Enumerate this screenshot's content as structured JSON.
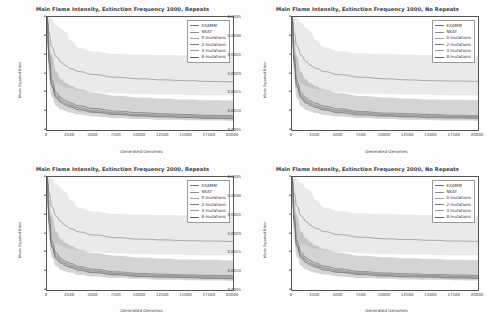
{
  "figure": {
    "background": "#fdfdfd",
    "axis_color": "#555555",
    "text_color": "#3c3c3c"
  },
  "common": {
    "xlabel": "Generated Genomes",
    "ylabel": "Mean Squared Error",
    "xticks": [
      "0",
      "2500",
      "5000",
      "7500",
      "10000",
      "12500",
      "15000",
      "17500",
      "20000"
    ],
    "xtick_values": [
      0,
      2500,
      5000,
      7500,
      10000,
      12500,
      15000,
      17500,
      20000
    ],
    "yticks": [
      "0.0035",
      "0.0030",
      "0.0025",
      "0.0020",
      "0.0015",
      "0.0010",
      "0.0005"
    ],
    "ytick_values": [
      0.0035,
      0.003,
      0.0025,
      0.002,
      0.0015,
      0.001,
      0.0005
    ],
    "xlim": [
      0,
      20000
    ],
    "ylim": [
      0.0005,
      0.0035
    ],
    "grid": false,
    "legend_position": "upper right"
  },
  "series_meta": [
    {
      "name": "EXAMM",
      "color": "#6e6e6e"
    },
    {
      "name": "NEAT",
      "color": "#8a8a8a"
    },
    {
      "name": "0 mutations",
      "color": "#a6a6a6"
    },
    {
      "name": "2 mutations",
      "color": "#7b7b7b"
    },
    {
      "name": "4 mutations",
      "color": "#9c9c9c"
    },
    {
      "name": "8 mutations",
      "color": "#5f5f5f"
    }
  ],
  "chart_data": [
    {
      "type": "line",
      "panel": "top-left",
      "title": "Main Flame Intensity, Extinction Frequency 1000, Repeats",
      "xlabel": "Generated Genomes",
      "ylabel": "Mean Squared Error",
      "xlim": [
        0,
        20000
      ],
      "ylim": [
        0.0005,
        0.0035
      ],
      "grid": false,
      "legend": [
        "EXAMM",
        "NEAT",
        "0 mutations",
        "2 mutations",
        "4 mutations",
        "8 mutations"
      ],
      "x": [
        0,
        250,
        500,
        1000,
        1500,
        2000,
        2500,
        3500,
        5000,
        7500,
        10000,
        12500,
        15000,
        17500,
        20000
      ],
      "series": [
        {
          "name": "EXAMM",
          "values": [
            0.0035,
            0.0025,
            0.00185,
            0.0015,
            0.00136,
            0.00128,
            0.00122,
            0.00114,
            0.00107,
            0.001,
            0.00096,
            0.00093,
            0.00091,
            0.00089,
            0.00088
          ]
        },
        {
          "name": "NEAT",
          "values": [
            0.0035,
            0.00305,
            0.00272,
            0.00245,
            0.0023,
            0.00221,
            0.00213,
            0.00205,
            0.00197,
            0.0019,
            0.00186,
            0.00183,
            0.00181,
            0.00179,
            0.00178
          ]
        },
        {
          "name": "0 mutations",
          "values": [
            0.0035,
            0.0024,
            0.00178,
            0.00145,
            0.00132,
            0.00124,
            0.00119,
            0.00111,
            0.00104,
            0.00097,
            0.00093,
            0.00091,
            0.00089,
            0.00087,
            0.00086
          ]
        },
        {
          "name": "2 mutations",
          "values": [
            0.0035,
            0.00235,
            0.00173,
            0.00141,
            0.00128,
            0.00121,
            0.00116,
            0.00108,
            0.00101,
            0.00095,
            0.00091,
            0.00089,
            0.00087,
            0.00085,
            0.00084
          ]
        },
        {
          "name": "4 mutations",
          "values": [
            0.0035,
            0.00232,
            0.0017,
            0.00138,
            0.00126,
            0.00119,
            0.00114,
            0.00106,
            0.00099,
            0.00093,
            0.00089,
            0.00087,
            0.00085,
            0.00083,
            0.00082
          ]
        },
        {
          "name": "8 mutations",
          "values": [
            0.0035,
            0.00228,
            0.00166,
            0.00135,
            0.00123,
            0.00116,
            0.00111,
            0.00103,
            0.00097,
            0.00091,
            0.00087,
            0.00085,
            0.00083,
            0.00081,
            0.0008
          ]
        }
      ],
      "bands": [
        {
          "name": "NEAT-range",
          "upper": [
            0.0035,
            0.0035,
            0.00345,
            0.0033,
            0.0032,
            0.0031,
            0.00288,
            0.00268,
            0.00258,
            0.00252,
            0.0025,
            0.00249,
            0.00248,
            0.00248,
            0.00247
          ],
          "lower": [
            0.003,
            0.00215,
            0.0019,
            0.00175,
            0.00168,
            0.00163,
            0.0016,
            0.00155,
            0.0015,
            0.00147,
            0.00145,
            0.00144,
            0.00143,
            0.00142,
            0.00141
          ]
        },
        {
          "name": "mutations-range",
          "upper": [
            0.0034,
            0.0029,
            0.0025,
            0.00205,
            0.00185,
            0.00175,
            0.00168,
            0.00158,
            0.00149,
            0.00141,
            0.00136,
            0.00133,
            0.00131,
            0.00129,
            0.00128
          ],
          "lower": [
            0.0028,
            0.00185,
            0.00138,
            0.00114,
            0.00105,
            0.001,
            0.00096,
            0.00091,
            0.00086,
            0.00082,
            0.00079,
            0.00077,
            0.00076,
            0.00075,
            0.00074
          ]
        }
      ]
    },
    {
      "type": "line",
      "panel": "top-right",
      "title": "Main Flame Intensity, Extinction Frequency 1000, No Repeats",
      "xlabel": "Generated Genomes",
      "ylabel": "Mean Squared Error",
      "xlim": [
        0,
        20000
      ],
      "ylim": [
        0.0005,
        0.0035
      ],
      "grid": false,
      "legend": [
        "EXAMM",
        "NEAT",
        "0 mutations",
        "2 mutations",
        "4 mutations",
        "8 mutations"
      ],
      "x": [
        0,
        250,
        500,
        1000,
        1500,
        2000,
        2500,
        3500,
        5000,
        7500,
        10000,
        12500,
        15000,
        17500,
        20000
      ],
      "series": [
        {
          "name": "EXAMM",
          "values": [
            0.0035,
            0.00248,
            0.00183,
            0.00149,
            0.00135,
            0.00127,
            0.00121,
            0.00113,
            0.00106,
            0.00099,
            0.00095,
            0.00093,
            0.00091,
            0.00089,
            0.00088
          ]
        },
        {
          "name": "NEAT",
          "values": [
            0.0035,
            0.00308,
            0.00275,
            0.00248,
            0.00232,
            0.00222,
            0.00214,
            0.00205,
            0.00197,
            0.0019,
            0.00186,
            0.00183,
            0.00181,
            0.0018,
            0.00179
          ]
        },
        {
          "name": "0 mutations",
          "values": [
            0.0035,
            0.00238,
            0.00176,
            0.00144,
            0.00131,
            0.00123,
            0.00118,
            0.0011,
            0.00103,
            0.00097,
            0.00093,
            0.00091,
            0.00089,
            0.00088,
            0.00087
          ]
        },
        {
          "name": "2 mutations",
          "values": [
            0.0035,
            0.00234,
            0.00172,
            0.0014,
            0.00128,
            0.0012,
            0.00115,
            0.00107,
            0.00101,
            0.00095,
            0.00091,
            0.00089,
            0.00087,
            0.00086,
            0.00085
          ]
        },
        {
          "name": "4 mutations",
          "values": [
            0.0035,
            0.00231,
            0.00169,
            0.00137,
            0.00125,
            0.00118,
            0.00113,
            0.00105,
            0.00099,
            0.00093,
            0.00089,
            0.00087,
            0.00086,
            0.00084,
            0.00083
          ]
        },
        {
          "name": "8 mutations",
          "values": [
            0.0035,
            0.00227,
            0.00165,
            0.00134,
            0.00122,
            0.00115,
            0.0011,
            0.00103,
            0.00096,
            0.0009,
            0.00087,
            0.00085,
            0.00083,
            0.00082,
            0.00081
          ]
        }
      ],
      "bands": [
        {
          "name": "NEAT-range",
          "upper": [
            0.0035,
            0.0035,
            0.00348,
            0.00335,
            0.00322,
            0.00312,
            0.0029,
            0.0027,
            0.00259,
            0.00253,
            0.00251,
            0.0025,
            0.00249,
            0.00248,
            0.00248
          ],
          "lower": [
            0.003,
            0.00213,
            0.00188,
            0.00174,
            0.00167,
            0.00162,
            0.00159,
            0.00154,
            0.0015,
            0.00146,
            0.00145,
            0.00144,
            0.00143,
            0.00142,
            0.00141
          ]
        },
        {
          "name": "mutations-range",
          "upper": [
            0.0034,
            0.00288,
            0.00248,
            0.00203,
            0.00184,
            0.00174,
            0.00167,
            0.00157,
            0.00148,
            0.0014,
            0.00136,
            0.00133,
            0.00131,
            0.0013,
            0.00129
          ],
          "lower": [
            0.0028,
            0.00184,
            0.00137,
            0.00113,
            0.00104,
            0.00099,
            0.00095,
            0.0009,
            0.00086,
            0.00082,
            0.00079,
            0.00077,
            0.00076,
            0.00075,
            0.00074
          ]
        }
      ]
    },
    {
      "type": "line",
      "panel": "bottom-left",
      "title": "Main Flame Intensity, Extinction Frequency 2000, Repeats",
      "xlabel": "Generated Genomes",
      "ylabel": "Mean Squared Error",
      "xlim": [
        0,
        20000
      ],
      "ylim": [
        0.0005,
        0.0035
      ],
      "grid": false,
      "legend": [
        "EXAMM",
        "NEAT",
        "0 mutations",
        "2 mutations",
        "4 mutations",
        "8 mutations"
      ],
      "x": [
        0,
        250,
        500,
        1000,
        1500,
        2000,
        2500,
        3500,
        5000,
        7500,
        10000,
        12500,
        15000,
        17500,
        20000
      ],
      "series": [
        {
          "name": "EXAMM",
          "values": [
            0.0035,
            0.00246,
            0.00182,
            0.00148,
            0.00134,
            0.00126,
            0.00121,
            0.00112,
            0.00105,
            0.00098,
            0.00094,
            0.00092,
            0.0009,
            0.00089,
            0.00088
          ]
        },
        {
          "name": "NEAT",
          "values": [
            0.0035,
            0.00306,
            0.00273,
            0.00246,
            0.00231,
            0.00221,
            0.00213,
            0.00204,
            0.00196,
            0.00189,
            0.00185,
            0.00183,
            0.00181,
            0.0018,
            0.00179
          ]
        },
        {
          "name": "0 mutations",
          "values": [
            0.0035,
            0.00237,
            0.00175,
            0.00143,
            0.0013,
            0.00123,
            0.00117,
            0.0011,
            0.00103,
            0.00096,
            0.00092,
            0.0009,
            0.00089,
            0.00087,
            0.00086
          ]
        },
        {
          "name": "2 mutations",
          "values": [
            0.0035,
            0.00233,
            0.00171,
            0.00139,
            0.00127,
            0.0012,
            0.00115,
            0.00107,
            0.001,
            0.00094,
            0.0009,
            0.00088,
            0.00087,
            0.00085,
            0.00084
          ]
        },
        {
          "name": "4 mutations",
          "values": [
            0.0035,
            0.0023,
            0.00168,
            0.00136,
            0.00124,
            0.00117,
            0.00112,
            0.00105,
            0.00098,
            0.00092,
            0.00088,
            0.00086,
            0.00085,
            0.00083,
            0.00082
          ]
        },
        {
          "name": "8 mutations",
          "values": [
            0.0035,
            0.00226,
            0.00164,
            0.00133,
            0.00121,
            0.00114,
            0.0011,
            0.00102,
            0.00096,
            0.0009,
            0.00086,
            0.00084,
            0.00083,
            0.00081,
            0.0008
          ]
        }
      ],
      "bands": [
        {
          "name": "NEAT-range",
          "upper": [
            0.0035,
            0.0035,
            0.00346,
            0.00332,
            0.0032,
            0.0031,
            0.00289,
            0.00268,
            0.00258,
            0.00252,
            0.0025,
            0.00249,
            0.00248,
            0.00248,
            0.00247
          ],
          "lower": [
            0.003,
            0.00214,
            0.00189,
            0.00174,
            0.00167,
            0.00163,
            0.00159,
            0.00155,
            0.0015,
            0.00147,
            0.00145,
            0.00144,
            0.00143,
            0.00142,
            0.00141
          ]
        },
        {
          "name": "mutations-range",
          "upper": [
            0.0034,
            0.00289,
            0.00249,
            0.00204,
            0.00185,
            0.00175,
            0.00168,
            0.00157,
            0.00148,
            0.00141,
            0.00136,
            0.00133,
            0.00131,
            0.0013,
            0.00128
          ],
          "lower": [
            0.0028,
            0.00184,
            0.00137,
            0.00113,
            0.00104,
            0.00099,
            0.00096,
            0.0009,
            0.00086,
            0.00082,
            0.00079,
            0.00077,
            0.00076,
            0.00075,
            0.00074
          ]
        }
      ]
    },
    {
      "type": "line",
      "panel": "bottom-right",
      "title": "Main Flame Intensity, Extinction Frequency 2000, No Repeats",
      "xlabel": "Generated Genomes",
      "ylabel": "Mean Squared Error",
      "xlim": [
        0,
        20000
      ],
      "ylim": [
        0.0005,
        0.0035
      ],
      "grid": false,
      "legend": [
        "EXAMM",
        "NEAT",
        "0 mutations",
        "2 mutations",
        "4 mutations",
        "8 mutations"
      ],
      "x": [
        0,
        250,
        500,
        1000,
        1500,
        2000,
        2500,
        3500,
        5000,
        7500,
        10000,
        12500,
        15000,
        17500,
        20000
      ],
      "series": [
        {
          "name": "EXAMM",
          "values": [
            0.0035,
            0.00249,
            0.00184,
            0.0015,
            0.00136,
            0.00128,
            0.00122,
            0.00113,
            0.00106,
            0.00099,
            0.00095,
            0.00093,
            0.00091,
            0.0009,
            0.00089
          ]
        },
        {
          "name": "NEAT",
          "values": [
            0.0035,
            0.00307,
            0.00274,
            0.00247,
            0.00232,
            0.00222,
            0.00214,
            0.00205,
            0.00197,
            0.0019,
            0.00186,
            0.00184,
            0.00182,
            0.0018,
            0.00179
          ]
        },
        {
          "name": "0 mutations",
          "values": [
            0.0035,
            0.00239,
            0.00177,
            0.00145,
            0.00132,
            0.00124,
            0.00118,
            0.00111,
            0.00104,
            0.00097,
            0.00093,
            0.00091,
            0.0009,
            0.00088,
            0.00087
          ]
        },
        {
          "name": "2 mutations",
          "values": [
            0.0035,
            0.00235,
            0.00173,
            0.00141,
            0.00129,
            0.00121,
            0.00116,
            0.00108,
            0.00101,
            0.00095,
            0.00091,
            0.00089,
            0.00088,
            0.00086,
            0.00085
          ]
        },
        {
          "name": "4 mutations",
          "values": [
            0.0035,
            0.00232,
            0.0017,
            0.00138,
            0.00126,
            0.00119,
            0.00114,
            0.00106,
            0.00099,
            0.00093,
            0.00089,
            0.00087,
            0.00086,
            0.00084,
            0.00083
          ]
        },
        {
          "name": "8 mutations",
          "values": [
            0.0035,
            0.00228,
            0.00166,
            0.00135,
            0.00123,
            0.00116,
            0.00111,
            0.00103,
            0.00097,
            0.00091,
            0.00087,
            0.00085,
            0.00084,
            0.00082,
            0.00081
          ]
        }
      ],
      "bands": [
        {
          "name": "NEAT-range",
          "upper": [
            0.0035,
            0.0035,
            0.00347,
            0.00334,
            0.00321,
            0.00311,
            0.0029,
            0.00269,
            0.00259,
            0.00253,
            0.00251,
            0.0025,
            0.00249,
            0.00248,
            0.00248
          ],
          "lower": [
            0.003,
            0.00214,
            0.00189,
            0.00175,
            0.00168,
            0.00163,
            0.0016,
            0.00155,
            0.0015,
            0.00147,
            0.00145,
            0.00144,
            0.00143,
            0.00142,
            0.00142
          ]
        },
        {
          "name": "mutations-range",
          "upper": [
            0.0034,
            0.0029,
            0.0025,
            0.00205,
            0.00186,
            0.00176,
            0.00168,
            0.00158,
            0.00149,
            0.00141,
            0.00137,
            0.00134,
            0.00132,
            0.0013,
            0.00129
          ],
          "lower": [
            0.0028,
            0.00185,
            0.00138,
            0.00114,
            0.00105,
            0.001,
            0.00096,
            0.00091,
            0.00086,
            0.00082,
            0.0008,
            0.00078,
            0.00077,
            0.00076,
            0.00075
          ]
        }
      ]
    }
  ]
}
